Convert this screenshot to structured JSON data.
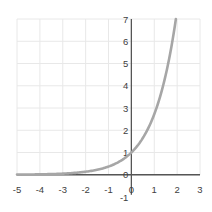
{
  "chart_data": {
    "type": "line",
    "title": "",
    "xlabel": "",
    "ylabel": "",
    "function": "y = e^x",
    "xlim": [
      -5,
      3
    ],
    "ylim": [
      -1,
      7
    ],
    "grid": true,
    "legend": null,
    "x_ticks": [
      -5,
      -4,
      -3,
      -2,
      -1,
      0,
      1,
      2,
      3
    ],
    "y_ticks": [
      -1,
      0,
      1,
      2,
      3,
      4,
      5,
      6,
      7
    ],
    "series": [
      {
        "name": "e^x",
        "color": "#a6a6a6",
        "x": [
          -5,
          -4,
          -3,
          -2,
          -1,
          0,
          0.5,
          1,
          1.5,
          2,
          2.5,
          2.95
        ],
        "y": [
          0.0067,
          0.018,
          0.05,
          0.135,
          0.368,
          1,
          1.649,
          2.718,
          4.482,
          7.389,
          12.18,
          19.1
        ]
      }
    ]
  },
  "colors": {
    "curve": "#a6a6a6",
    "axis": "#555555",
    "grid": "#e8e8e8",
    "text": "#404040"
  }
}
